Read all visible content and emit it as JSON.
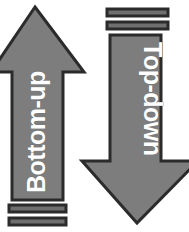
{
  "diagram": {
    "background_color": "#ffffff",
    "arrow_fill_color": "#7d7d7d",
    "arrow_outline_color": "#2b2b2b",
    "label_color": "#ffffff",
    "stripe_fill_color": "#6f6f6f",
    "arrows": [
      {
        "id": "bottom-up",
        "label": "Bottom-up",
        "direction": "up",
        "text_orientation": "rotated-90-ccw",
        "tail_stripes": 2,
        "tail_position": "bottom"
      },
      {
        "id": "top-down",
        "label": "Top-down",
        "direction": "down",
        "text_orientation": "rotated-90-cw",
        "tail_stripes": 2,
        "tail_position": "top"
      }
    ]
  }
}
